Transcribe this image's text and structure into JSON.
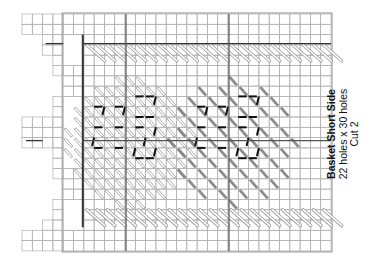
{
  "caption": {
    "title": "Basket Short Side",
    "size": "22 holes x 30 holes",
    "cut": "Cut 2"
  },
  "grid": {
    "origin_x": 22,
    "origin_y": 14,
    "cell": 10.3,
    "cols": 30,
    "rows": 23,
    "line_color": "#b0b0b0",
    "border_color": "#a0a0a0",
    "dark_line_color": "#333333"
  },
  "colors": {
    "outline_stitch_stroke": "#9a9a9a",
    "outline_stitch_fill": "#ffffff",
    "solid_stitch_fill": "#8c8c8c",
    "backstitch": "#111111",
    "center_line": "#555555"
  },
  "legend": {
    "motif_left": "outlined stitch motif",
    "motif_right": "solid gray stitch motif"
  }
}
